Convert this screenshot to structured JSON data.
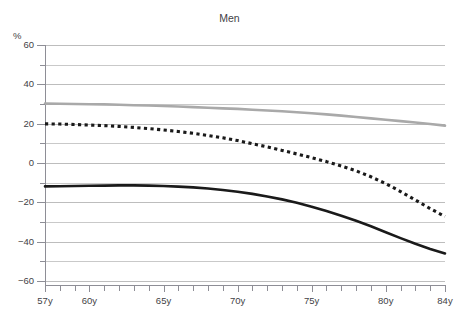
{
  "clipped_header_text": "",
  "chart_title": "Men",
  "unit_label": "%",
  "colors": {
    "gray_series": "#a9a9a9",
    "black_series": "#1a1a1a",
    "gridline": "#c9c9c9",
    "axis": "#8e8e96",
    "text": "#3f3f46"
  },
  "axes": {
    "y_unit": "%",
    "y_labels": [
      "60",
      "40",
      "20",
      "0",
      "-20",
      "-40",
      "-60"
    ],
    "y_label_values": [
      60,
      40,
      20,
      0,
      -20,
      -40,
      -60
    ],
    "y_minor_step": 10,
    "x_labels": [
      "57y",
      "60y",
      "65y",
      "70y",
      "75y",
      "80y",
      "84y"
    ],
    "x_label_values": [
      57,
      60,
      65,
      70,
      75,
      80,
      84
    ],
    "x_tick_values": [
      57,
      58,
      59,
      60,
      61,
      62,
      63,
      64,
      65,
      66,
      67,
      68,
      69,
      70,
      71,
      72,
      73,
      74,
      75,
      76,
      77,
      78,
      79,
      80,
      81,
      82,
      83,
      84
    ]
  },
  "chart_data": {
    "type": "line",
    "title": "Men",
    "xlabel": "",
    "ylabel": "%",
    "xlim": [
      57,
      84
    ],
    "ylim": [
      -60,
      60
    ],
    "grid": true,
    "legend": "none",
    "x": [
      57,
      58,
      59,
      60,
      61,
      62,
      63,
      64,
      65,
      66,
      67,
      68,
      69,
      70,
      71,
      72,
      73,
      74,
      75,
      76,
      77,
      78,
      79,
      80,
      81,
      82,
      83,
      84
    ],
    "series": [
      {
        "name": "upper-gray-line",
        "style": "solid",
        "color": "#a9a9a9",
        "values": [
          30.2,
          30.1,
          30.0,
          29.9,
          29.8,
          29.6,
          29.4,
          29.2,
          29.0,
          28.7,
          28.4,
          28.1,
          27.8,
          27.5,
          27.1,
          26.7,
          26.3,
          25.8,
          25.3,
          24.7,
          24.1,
          23.4,
          22.7,
          22.0,
          21.3,
          20.6,
          19.8,
          19.0
        ]
      },
      {
        "name": "middle-dotted-line",
        "style": "dotted",
        "color": "#1a1a1a",
        "values": [
          19.9,
          19.8,
          19.6,
          19.3,
          19.0,
          18.6,
          18.1,
          17.5,
          16.8,
          16.0,
          15.1,
          14.0,
          12.8,
          11.4,
          9.8,
          8.2,
          6.4,
          4.6,
          2.7,
          0.7,
          -1.5,
          -4.0,
          -7.0,
          -10.5,
          -14.5,
          -18.8,
          -23.2,
          -27.2
        ]
      },
      {
        "name": "lower-black-line",
        "style": "solid",
        "color": "#1a1a1a",
        "values": [
          -11.9,
          -11.8,
          -11.7,
          -11.6,
          -11.5,
          -11.4,
          -11.4,
          -11.5,
          -11.7,
          -12.0,
          -12.4,
          -13.0,
          -13.7,
          -14.6,
          -15.7,
          -17.0,
          -18.5,
          -20.2,
          -22.2,
          -24.4,
          -26.8,
          -29.4,
          -32.2,
          -35.2,
          -38.2,
          -41.1,
          -43.7,
          -46.0
        ]
      }
    ]
  }
}
